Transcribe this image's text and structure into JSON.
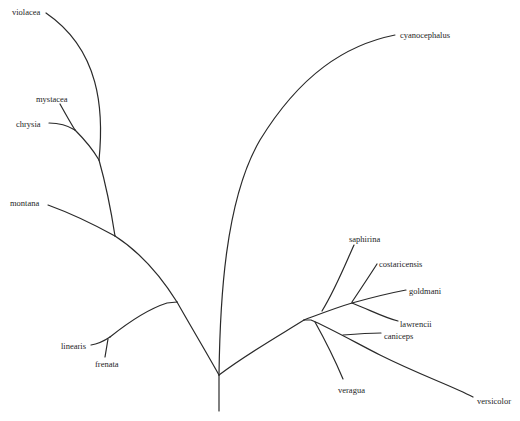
{
  "diagram": {
    "type": "phylogenetic-tree",
    "taxa": [
      {
        "id": "violacea",
        "label": "violacea",
        "x": 12,
        "y": 7
      },
      {
        "id": "mystacea",
        "label": "mystacea",
        "x": 36,
        "y": 94
      },
      {
        "id": "chrysia",
        "label": "chrysia",
        "x": 16,
        "y": 119
      },
      {
        "id": "montana",
        "label": "montana",
        "x": 10,
        "y": 198
      },
      {
        "id": "linearis",
        "label": "linearis",
        "x": 61,
        "y": 341
      },
      {
        "id": "frenata",
        "label": "frenata",
        "x": 95,
        "y": 359
      },
      {
        "id": "cyanocephalus",
        "label": "cyanocephalus",
        "x": 400,
        "y": 30
      },
      {
        "id": "saphirina",
        "label": "saphirina",
        "x": 349,
        "y": 234
      },
      {
        "id": "costaricensis",
        "label": "costaricensis",
        "x": 379,
        "y": 259
      },
      {
        "id": "goldmani",
        "label": "goldmani",
        "x": 409,
        "y": 287
      },
      {
        "id": "lawrencii",
        "label": "lawrencii",
        "x": 400,
        "y": 320
      },
      {
        "id": "caniceps",
        "label": "caniceps",
        "x": 384,
        "y": 332
      },
      {
        "id": "veragua",
        "label": "veragua",
        "x": 338,
        "y": 385
      },
      {
        "id": "versicolor",
        "label": "versicolor",
        "x": 477,
        "y": 396
      }
    ]
  }
}
